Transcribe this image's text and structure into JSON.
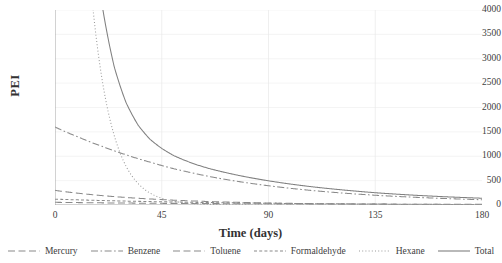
{
  "chart_data": {
    "type": "line",
    "title": "",
    "xlabel": "Time (days)",
    "ylabel": "PEI",
    "xlim": [
      0,
      180
    ],
    "ylim": [
      0,
      4000
    ],
    "xticks": [
      0,
      45,
      90,
      135,
      180
    ],
    "yticks": [
      0,
      500,
      1000,
      1500,
      2000,
      2500,
      3000,
      3500,
      4000
    ],
    "grid": true,
    "legend_position": "bottom",
    "x": [
      0,
      5,
      10,
      15,
      20,
      25,
      30,
      35,
      40,
      45,
      50,
      55,
      60,
      65,
      70,
      75,
      80,
      90,
      100,
      110,
      120,
      135,
      150,
      165,
      180
    ],
    "series": [
      {
        "name": "Mercury",
        "dash": "long-dash",
        "color": "#8a8a8a",
        "values": [
          55,
          52,
          49,
          46,
          44,
          42,
          40,
          38,
          36,
          34,
          33,
          31,
          30,
          29,
          28,
          27,
          26,
          24,
          23,
          21,
          20,
          18,
          17,
          16,
          15
        ]
      },
      {
        "name": "Benzene",
        "dash": "dash-dot",
        "color": "#8a8a8a",
        "values": [
          1600,
          1490,
          1390,
          1290,
          1200,
          1110,
          1030,
          950,
          880,
          810,
          745,
          690,
          635,
          585,
          540,
          500,
          462,
          395,
          338,
          290,
          250,
          200,
          162,
          132,
          108
        ]
      },
      {
        "name": "Toluene",
        "dash": "long-dash",
        "color": "#8a8a8a",
        "values": [
          300,
          268,
          240,
          215,
          192,
          172,
          154,
          138,
          124,
          111,
          99,
          89,
          80,
          71,
          64,
          57,
          51,
          41,
          33,
          27,
          21,
          15,
          11,
          8,
          6
        ]
      },
      {
        "name": "Formaldehyde",
        "dash": "short-dash",
        "color": "#8a8a8a",
        "values": [
          120,
          112,
          105,
          98,
          92,
          86,
          80,
          75,
          70,
          66,
          62,
          58,
          54,
          50,
          47,
          44,
          41,
          36,
          31,
          27,
          24,
          19,
          15,
          12,
          10
        ]
      },
      {
        "name": "Hexane",
        "dash": "dotted",
        "color": "#9a9a9a",
        "values": [
          26000,
          14500,
          8100,
          4530,
          2530,
          1420,
          790,
          442,
          247,
          138,
          77,
          43,
          24,
          14,
          7.6,
          4.3,
          2.4,
          0.8,
          0.2,
          0.1,
          0.02,
          0.01,
          0,
          0,
          0
        ]
      },
      {
        "name": "Total",
        "dash": "solid",
        "color": "#808080",
        "values": [
          28075,
          16430,
          9880,
          6180,
          4060,
          2830,
          2095,
          1640,
          1350,
          1160,
          1015,
          910,
          822,
          748,
          687,
          632,
          582,
          496,
          425,
          365,
          315,
          252,
          205,
          168,
          139
        ]
      }
    ]
  }
}
